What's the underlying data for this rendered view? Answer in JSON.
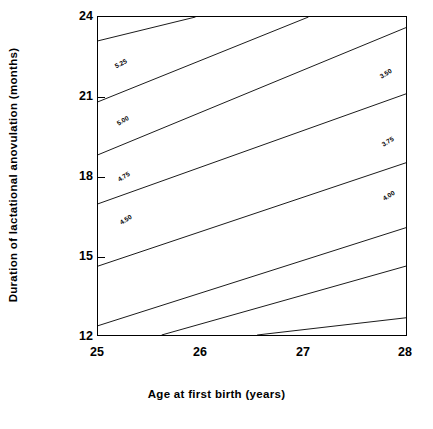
{
  "chart_data": {
    "type": "line",
    "subtype": "contour",
    "title": "",
    "xlabel": "Age at first birth (years)",
    "ylabel": "Duration of lactational anovulation (months)",
    "xlim": [
      25,
      28
    ],
    "ylim": [
      12,
      24
    ],
    "xticks": [
      "25",
      "26",
      "27",
      "28"
    ],
    "xtick_values": [
      25,
      26,
      27,
      28
    ],
    "yticks": [
      "24",
      "21",
      "18",
      "15",
      "12"
    ],
    "ytick_values": [
      24,
      21,
      18,
      15,
      12
    ],
    "grid": false,
    "legend": "none",
    "contour_interval": 0.25,
    "contour_levels": [
      3.5,
      3.75,
      4.0,
      4.25,
      4.5,
      4.75,
      5.0,
      5.25
    ],
    "contours": [
      {
        "level": "5.25",
        "value": 5.25,
        "label_visible": true,
        "label_x": 25.25,
        "label_y": 22.55,
        "points": [
          [
            25.0,
            23.1
          ],
          [
            25.95,
            24.0
          ]
        ]
      },
      {
        "level": "5.00",
        "value": 5.0,
        "label_visible": true,
        "label_x": 25.28,
        "label_y": 20.1,
        "points": [
          [
            25.0,
            20.8
          ],
          [
            27.05,
            24.0
          ]
        ]
      },
      {
        "level": "4.75",
        "value": 4.75,
        "label_visible": true,
        "label_x": 25.28,
        "label_y": 17.75,
        "points": [
          [
            25.0,
            18.8
          ],
          [
            28.0,
            23.6
          ]
        ]
      },
      {
        "level": "4.50",
        "value": 4.5,
        "label_visible": true,
        "label_x": 25.28,
        "label_y": 15.55,
        "points": [
          [
            25.0,
            16.95
          ],
          [
            28.0,
            21.1
          ]
        ],
        "label_right": true,
        "label_right_x": 27.72,
        "label_right_y": 20.75
      },
      {
        "level": "3.75",
        "value": 3.75,
        "label_visible": true,
        "label_x": 27.72,
        "label_y": 18.35,
        "points": [
          [
            25.0,
            14.6
          ],
          [
            28.0,
            18.5
          ]
        ]
      },
      {
        "level": "4.00",
        "value": 4.0,
        "label_visible": true,
        "label_x": 27.7,
        "label_y": 16.2,
        "points": [
          [
            25.0,
            12.35
          ],
          [
            28.0,
            16.05
          ]
        ]
      },
      {
        "level": "3.50b",
        "value": 3.5,
        "label_visible": false,
        "points": [
          [
            25.62,
            12.0
          ],
          [
            28.0,
            14.6
          ]
        ]
      },
      {
        "level": "3.25b",
        "value": 3.25,
        "label_visible": false,
        "points": [
          [
            26.55,
            12.0
          ],
          [
            28.0,
            12.65
          ]
        ]
      }
    ],
    "contour_labels": [
      {
        "text": "5.25",
        "x": 121,
        "y": 64,
        "rotate": -28
      },
      {
        "text": "5.00",
        "x": 123,
        "y": 121,
        "rotate": -30
      },
      {
        "text": "4.75",
        "x": 124,
        "y": 177,
        "rotate": -31
      },
      {
        "text": "4.50",
        "x": 126,
        "y": 220,
        "rotate": -31
      },
      {
        "text": "3.50",
        "x": 386,
        "y": 74,
        "rotate": -31
      },
      {
        "text": "3.75",
        "x": 388,
        "y": 142,
        "rotate": -31
      },
      {
        "text": "4.00",
        "x": 389,
        "y": 196,
        "rotate": -31
      }
    ]
  }
}
